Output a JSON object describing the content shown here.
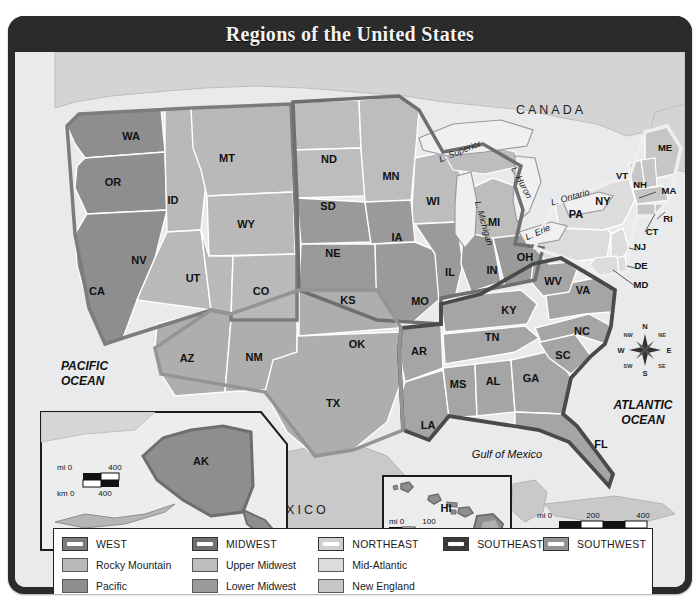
{
  "title": "Regions of the United States",
  "colors": {
    "pacific": "#8e8e8e",
    "rocky_mountain": "#b9b9b9",
    "upper_midwest": "#bdbdbd",
    "lower_midwest": "#9a9a9a",
    "mid_atlantic": "#dcdcdc",
    "new_england": "#c6c6c6",
    "southeast": "#a5a5a5",
    "southwest": "#aeaeae",
    "west_border": "#7c7c7c",
    "midwest_border": "#6f6f6f",
    "northeast_border": "#efefef",
    "southeast_border": "#4a4a4a",
    "southwest_border": "#949494",
    "ocean": "#e9eaec",
    "canada": "#d4d4d4",
    "mexico": "#c9c9c9",
    "lake": "#f0f0f0",
    "frame": "#2b2b2b",
    "title_text": "#f2f2f2"
  },
  "legend": {
    "columns": [
      {
        "header": {
          "label": "WEST",
          "swatch": "#7c7c7c"
        },
        "items": [
          {
            "label": "Rocky Mountain",
            "swatch": "#b9b9b9"
          },
          {
            "label": "Pacific",
            "swatch": "#8e8e8e"
          }
        ]
      },
      {
        "header": {
          "label": "MIDWEST",
          "swatch": "#6f6f6f"
        },
        "items": [
          {
            "label": "Upper Midwest",
            "swatch": "#bdbdbd"
          },
          {
            "label": "Lower Midwest",
            "swatch": "#9a9a9a"
          }
        ]
      },
      {
        "header": {
          "label": "NORTHEAST",
          "swatch": "#efefef"
        },
        "items": [
          {
            "label": "Mid-Atlantic",
            "swatch": "#dcdcdc"
          },
          {
            "label": "New England",
            "swatch": "#c6c6c6"
          }
        ]
      },
      {
        "header": {
          "label": "SOUTHEAST",
          "swatch": "#3a3a3a"
        },
        "items": []
      },
      {
        "header": {
          "label": "SOUTHWEST",
          "swatch": "#949494"
        },
        "items": []
      }
    ]
  },
  "map": {
    "countries": [
      {
        "name": "CANADA",
        "x": 536,
        "y": 62
      },
      {
        "name": "MEXICO",
        "x": 280,
        "y": 462
      }
    ],
    "oceans": [
      {
        "name": "PACIFIC",
        "x": 46,
        "y": 318
      },
      {
        "name": "OCEAN",
        "x": 46,
        "y": 333
      },
      {
        "name": "ATLANTIC",
        "x": 628,
        "y": 357
      },
      {
        "name": "OCEAN",
        "x": 628,
        "y": 372
      }
    ],
    "gulf": {
      "name": "Gulf of Mexico",
      "x": 492,
      "y": 406
    },
    "lakes": [
      {
        "name": "L. Superior",
        "x": 446,
        "y": 102,
        "rotate": -22
      },
      {
        "name": "L. Michigan",
        "x": 466,
        "y": 172,
        "rotate": 74
      },
      {
        "name": "L. Huron",
        "x": 504,
        "y": 132,
        "rotate": 62
      },
      {
        "name": "L. Ontario",
        "x": 556,
        "y": 148,
        "rotate": -16
      },
      {
        "name": "L. Erie",
        "x": 524,
        "y": 183,
        "rotate": -24
      }
    ],
    "states": [
      {
        "code": "WA",
        "x": 116,
        "y": 88,
        "region": "pacific"
      },
      {
        "code": "OR",
        "x": 98,
        "y": 134,
        "region": "pacific"
      },
      {
        "code": "CA",
        "x": 82,
        "y": 243,
        "region": "pacific"
      },
      {
        "code": "ID",
        "x": 158,
        "y": 152,
        "region": "rocky"
      },
      {
        "code": "MT",
        "x": 212,
        "y": 110,
        "region": "rocky"
      },
      {
        "code": "WY",
        "x": 231,
        "y": 176,
        "region": "rocky"
      },
      {
        "code": "NV",
        "x": 124,
        "y": 212,
        "region": "rocky"
      },
      {
        "code": "UT",
        "x": 178,
        "y": 230,
        "region": "rocky"
      },
      {
        "code": "CO",
        "x": 246,
        "y": 243,
        "region": "rocky"
      },
      {
        "code": "ND",
        "x": 314,
        "y": 111,
        "region": "upper-midwest"
      },
      {
        "code": "SD",
        "x": 313,
        "y": 158,
        "region": "upper-midwest"
      },
      {
        "code": "MN",
        "x": 376,
        "y": 128,
        "region": "upper-midwest"
      },
      {
        "code": "WI",
        "x": 418,
        "y": 153,
        "region": "upper-midwest"
      },
      {
        "code": "MI",
        "x": 479,
        "y": 174,
        "region": "upper-midwest"
      },
      {
        "code": "NE",
        "x": 318,
        "y": 205,
        "region": "lower-midwest"
      },
      {
        "code": "KS",
        "x": 333,
        "y": 252,
        "region": "lower-midwest"
      },
      {
        "code": "IA",
        "x": 382,
        "y": 189,
        "region": "lower-midwest"
      },
      {
        "code": "MO",
        "x": 405,
        "y": 253,
        "region": "lower-midwest"
      },
      {
        "code": "IL",
        "x": 435,
        "y": 224,
        "region": "lower-midwest"
      },
      {
        "code": "IN",
        "x": 477,
        "y": 222,
        "region": "lower-midwest"
      },
      {
        "code": "OH",
        "x": 510,
        "y": 209,
        "region": "lower-midwest"
      },
      {
        "code": "OK",
        "x": 342,
        "y": 296,
        "region": "southwest"
      },
      {
        "code": "TX",
        "x": 318,
        "y": 355,
        "region": "southwest"
      },
      {
        "code": "NM",
        "x": 239,
        "y": 309,
        "region": "southwest"
      },
      {
        "code": "AZ",
        "x": 172,
        "y": 310,
        "region": "southwest"
      },
      {
        "code": "AR",
        "x": 404,
        "y": 303,
        "region": "southeast"
      },
      {
        "code": "LA",
        "x": 413,
        "y": 377,
        "region": "southeast"
      },
      {
        "code": "MS",
        "x": 443,
        "y": 336,
        "region": "southeast"
      },
      {
        "code": "AL",
        "x": 478,
        "y": 333,
        "region": "southeast"
      },
      {
        "code": "GA",
        "x": 516,
        "y": 330,
        "region": "southeast"
      },
      {
        "code": "FL",
        "x": 586,
        "y": 396,
        "region": "southeast"
      },
      {
        "code": "TN",
        "x": 477,
        "y": 289,
        "region": "southeast"
      },
      {
        "code": "KY",
        "x": 494,
        "y": 262,
        "region": "southeast"
      },
      {
        "code": "SC",
        "x": 548,
        "y": 307,
        "region": "southeast"
      },
      {
        "code": "NC",
        "x": 567,
        "y": 283,
        "region": "southeast"
      },
      {
        "code": "VA",
        "x": 568,
        "y": 242,
        "region": "southeast"
      },
      {
        "code": "WV",
        "x": 538,
        "y": 233,
        "region": "southeast"
      },
      {
        "code": "PA",
        "x": 561,
        "y": 166,
        "region": "mid-atlantic"
      },
      {
        "code": "NY",
        "x": 588,
        "y": 153,
        "region": "mid-atlantic"
      },
      {
        "code": "NJ",
        "x": 625,
        "y": 198,
        "region": "mid-atlantic"
      },
      {
        "code": "DE",
        "x": 626,
        "y": 217,
        "region": "mid-atlantic"
      },
      {
        "code": "MD",
        "x": 626,
        "y": 236,
        "region": "mid-atlantic"
      },
      {
        "code": "ME",
        "x": 650,
        "y": 99,
        "region": "new-england"
      },
      {
        "code": "VT",
        "x": 607,
        "y": 127,
        "region": "new-england"
      },
      {
        "code": "NH",
        "x": 625,
        "y": 136,
        "region": "new-england"
      },
      {
        "code": "MA",
        "x": 654,
        "y": 142,
        "region": "new-england"
      },
      {
        "code": "RI",
        "x": 653,
        "y": 170,
        "region": "new-england"
      },
      {
        "code": "CT",
        "x": 637,
        "y": 183,
        "region": "new-england"
      }
    ],
    "insets": [
      {
        "name": "AK",
        "label_x": 186,
        "label_y": 413
      },
      {
        "name": "HI",
        "label_x": 431,
        "label_y": 460
      }
    ],
    "compass": {
      "x": 630,
      "y": 298,
      "points": [
        "N",
        "E",
        "S",
        "W",
        "NE",
        "SE",
        "SW",
        "NW"
      ]
    },
    "scales": [
      {
        "id": "main-scale",
        "mi_label": "mi 0",
        "km_label": "km 0",
        "mi_ticks": [
          "200",
          "400"
        ],
        "km_ticks": [
          "200",
          "400"
        ]
      },
      {
        "id": "alaska-scale",
        "mi_label": "mi 0",
        "km_label": "km 0",
        "mi_ticks": [
          "400"
        ],
        "km_ticks": [
          "400"
        ]
      },
      {
        "id": "hawaii-scale",
        "mi_label": "mi 0",
        "km_label": "km 0",
        "mi_ticks": [
          "100"
        ],
        "km_ticks": [
          "100"
        ]
      }
    ]
  }
}
